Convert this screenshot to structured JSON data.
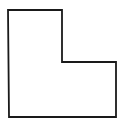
{
  "diagram": {
    "type": "polygon-outline",
    "shape": "L-shape",
    "stroke_color": "#1a1a1a",
    "fill_color": "#ffffff",
    "stroke_width": 1.8,
    "points": [
      [
        8,
        10
      ],
      [
        62,
        10
      ],
      [
        62,
        62
      ],
      [
        116,
        62
      ],
      [
        116,
        117
      ],
      [
        9,
        117
      ]
    ]
  }
}
